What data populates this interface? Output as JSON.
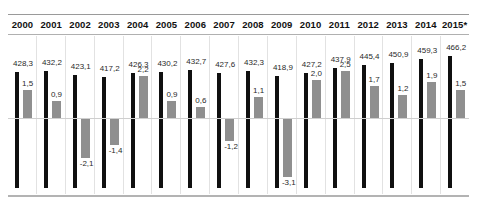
{
  "chart_data": {
    "type": "bar",
    "title": "",
    "subtitle": "",
    "xlabel": "",
    "ylabel": "",
    "grid": true,
    "legend_position": "none",
    "axis": {
      "zero_line": true,
      "growth_ylim": [
        -3.5,
        3.0
      ],
      "total_ylim": [
        0,
        480
      ]
    },
    "categories": [
      "2000",
      "2001",
      "2002",
      "2003",
      "2004",
      "2005",
      "2006",
      "2007",
      "2008",
      "2009",
      "2010",
      "2011",
      "2012",
      "2013",
      "2014",
      "2015*"
    ],
    "series": [
      {
        "name": "total",
        "color": "#101010",
        "values": [
          428.3,
          432.2,
          423.1,
          417.2,
          426.3,
          430.2,
          432.7,
          427.6,
          432.3,
          418.9,
          427.2,
          437.9,
          445.4,
          450.9,
          459.3,
          466.2
        ],
        "labels": [
          "428,3",
          "432,2",
          "423,1",
          "417,2",
          "426,3",
          "430,2",
          "432,7",
          "427,6",
          "432,3",
          "418,9",
          "427,2",
          "437,9",
          "445,4",
          "450,9",
          "459,3",
          "466,2"
        ]
      },
      {
        "name": "growth",
        "color": "#8f8f8f",
        "values": [
          1.5,
          0.9,
          -2.1,
          -1.4,
          2.2,
          0.9,
          0.6,
          -1.2,
          1.1,
          -3.1,
          2.0,
          2.5,
          1.7,
          1.2,
          1.9,
          1.5
        ],
        "labels": [
          "1,5",
          "0,9",
          "-2,1",
          "-1,4",
          "2,2",
          "0,9",
          "0,6",
          "-1,2",
          "1,1",
          "-3,1",
          "2,0",
          "2,5",
          "1,7",
          "1,2",
          "1,9",
          "1,5"
        ]
      }
    ]
  }
}
